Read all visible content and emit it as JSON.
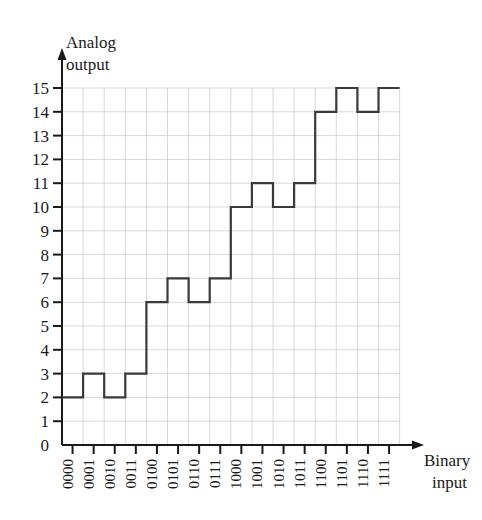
{
  "chart_data": {
    "type": "line",
    "title": "",
    "subtitle": "",
    "xlabel": "Binary input",
    "ylabel": "Analog output",
    "ylabel_line1": "Analog",
    "ylabel_line2": "output",
    "xlabel_line1": "Binary",
    "xlabel_line2": "input",
    "categories": [
      "0000",
      "0001",
      "0010",
      "0011",
      "0100",
      "0101",
      "0110",
      "0111",
      "1000",
      "1001",
      "1010",
      "1011",
      "1100",
      "1101",
      "1110",
      "1111"
    ],
    "values": [
      2,
      3,
      2,
      3,
      6,
      7,
      6,
      7,
      10,
      11,
      10,
      11,
      14,
      15,
      14,
      15
    ],
    "y_ticks": [
      0,
      1,
      2,
      3,
      4,
      5,
      6,
      7,
      8,
      9,
      10,
      11,
      12,
      13,
      14,
      15
    ],
    "y_tick_labels": [
      "0",
      "1",
      "2",
      "3",
      "4",
      "5",
      "6",
      "7",
      "8",
      "9",
      "10",
      "11",
      "12",
      "13",
      "14",
      "15"
    ],
    "ylim": [
      0,
      15
    ],
    "xlim": [
      0,
      16
    ],
    "grid": true,
    "legend": false,
    "legend_position": "none",
    "step_style": "post",
    "series": [
      {
        "name": "analog output",
        "values": [
          2,
          3,
          2,
          3,
          6,
          7,
          6,
          7,
          10,
          11,
          10,
          11,
          14,
          15,
          14,
          15
        ]
      }
    ],
    "colors": {
      "line": "#3a3a3a",
      "grid": "#c8c8c8",
      "axis": "#1a1a1a",
      "text": "#1a1a1a",
      "background": "#ffffff"
    }
  }
}
